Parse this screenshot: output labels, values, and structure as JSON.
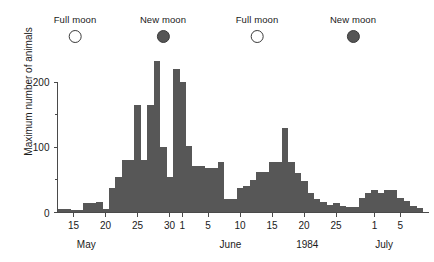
{
  "chart_data": {
    "type": "bar",
    "title": "",
    "xlabel": "1984",
    "ylabel": "Maximum number of animals",
    "ylim": [
      0,
      215
    ],
    "yticks": [
      0,
      100,
      200
    ],
    "yticks_minor": [
      50,
      150
    ],
    "grid": false,
    "legend": "none",
    "bar_color": "#575757",
    "axis_color": "#4a4a4a",
    "x_axis_start_day": 13,
    "x_axis_end_day": 71,
    "categories": [
      "May 13",
      "May 14",
      "May 15",
      "May 16",
      "May 17",
      "May 18",
      "May 19",
      "May 20",
      "May 21",
      "May 22",
      "May 23",
      "May 24",
      "May 25",
      "May 26",
      "May 27",
      "May 28",
      "May 29",
      "May 30",
      "May 31",
      "Jun 1",
      "Jun 2",
      "Jun 3",
      "Jun 4",
      "Jun 5",
      "Jun 6",
      "Jun 7",
      "Jun 8",
      "Jun 9",
      "Jun 10",
      "Jun 11",
      "Jun 12",
      "Jun 13",
      "Jun 14",
      "Jun 15",
      "Jun 16",
      "Jun 17",
      "Jun 18",
      "Jun 19",
      "Jun 20",
      "Jun 21",
      "Jun 22",
      "Jun 23",
      "Jun 24",
      "Jun 25",
      "Jun 26",
      "Jun 27",
      "Jun 28",
      "Jun 29",
      "Jun 30",
      "Jul 1",
      "Jul 2",
      "Jul 3",
      "Jul 4",
      "Jul 5",
      "Jul 6",
      "Jul 7",
      "Jul 8"
    ],
    "values": [
      6,
      6,
      4,
      4,
      14,
      14,
      16,
      6,
      38,
      55,
      80,
      80,
      165,
      80,
      165,
      232,
      100,
      55,
      220,
      200,
      102,
      72,
      72,
      68,
      68,
      78,
      20,
      20,
      38,
      40,
      50,
      62,
      62,
      78,
      78,
      130,
      78,
      60,
      48,
      30,
      20,
      16,
      12,
      14,
      10,
      9,
      9,
      22,
      30,
      34,
      30,
      34,
      34,
      22,
      18,
      10,
      7
    ],
    "xticks": [
      {
        "day": 15,
        "label": "15"
      },
      {
        "day": 20,
        "label": "20"
      },
      {
        "day": 25,
        "label": "25"
      },
      {
        "day": 30,
        "label": "30"
      },
      {
        "day": 32,
        "label": "1"
      },
      {
        "day": 36,
        "label": "5"
      },
      {
        "day": 41,
        "label": "10"
      },
      {
        "day": 46,
        "label": "15"
      },
      {
        "day": 51,
        "label": "20"
      },
      {
        "day": 56,
        "label": "25"
      },
      {
        "day": 62,
        "label": "1"
      },
      {
        "day": 66,
        "label": "5"
      }
    ],
    "month_labels": [
      {
        "day": 17.5,
        "label": "May"
      },
      {
        "day": 40,
        "label": "June"
      },
      {
        "day": 52,
        "label": "1984"
      },
      {
        "day": 64,
        "label": "July"
      }
    ]
  },
  "moon_markers": [
    {
      "label": "Full moon",
      "phase": "full",
      "x": 75
    },
    {
      "label": "New moon",
      "phase": "new",
      "x": 163
    },
    {
      "label": "Full moon",
      "phase": "full",
      "x": 257
    },
    {
      "label": "New moon",
      "phase": "new",
      "x": 353
    }
  ]
}
